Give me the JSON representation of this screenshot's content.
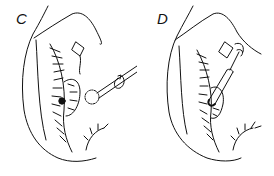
{
  "figure": {
    "panels": [
      {
        "label": "C",
        "description": "rotating burr instrument approaching lesion on eyelid margin"
      },
      {
        "label": "D",
        "description": "cylindrical probe inserted into lesion on eyelid margin"
      }
    ]
  },
  "colors": {
    "ink": "#111111",
    "background": "#ffffff"
  }
}
